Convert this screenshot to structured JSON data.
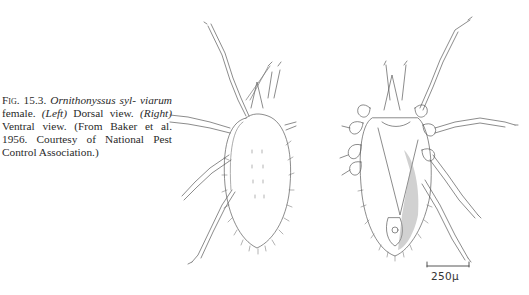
{
  "caption": {
    "figure_number": "Fig. 15.3.",
    "species_line1": "Ornithonyssus syl-",
    "species_line2": "viarum",
    "text_after_species": " female. ",
    "left_label": "(Left)",
    "left_text": " Dorsal view. ",
    "right_label": "(Right)",
    "right_text": " Ventral view. (From Baker et al. 1956. Courtesy of National Pest Control Association.)"
  },
  "figures": [
    {
      "name": "dorsal-view",
      "label": "Dorsal view"
    },
    {
      "name": "ventral-view",
      "label": "Ventral view"
    }
  ],
  "scale_bar": {
    "label": "250μ"
  },
  "colors": {
    "ink": "#555555",
    "background": "#ffffff"
  }
}
